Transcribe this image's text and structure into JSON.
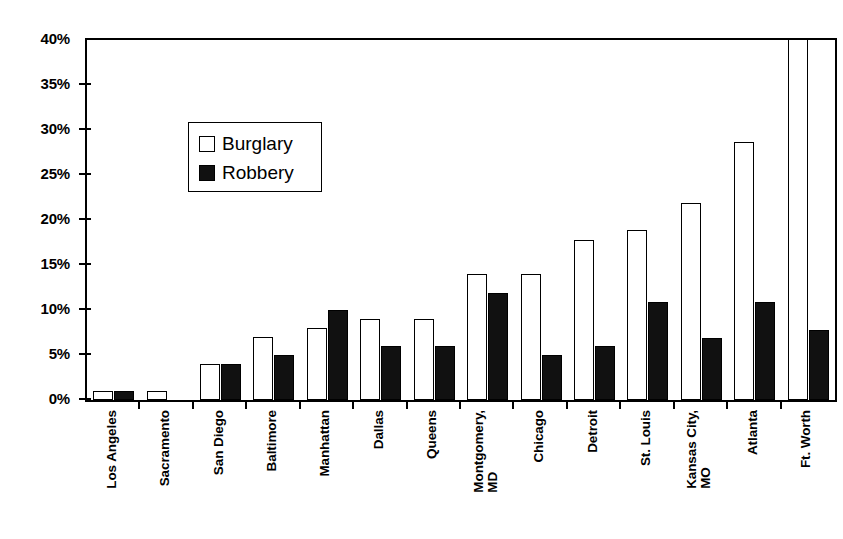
{
  "chart_data": {
    "type": "bar",
    "title": "",
    "subtitle": "",
    "xlabel": "",
    "ylabel": "",
    "ylim": [
      0,
      40
    ],
    "ytick_step": 5,
    "ytick_labels": [
      "40%",
      "35%",
      "30%",
      "25%",
      "20%",
      "15%",
      "10%",
      "5%",
      "0%"
    ],
    "ytick_values": [
      40,
      35,
      30,
      25,
      20,
      15,
      10,
      5,
      0
    ],
    "grid": false,
    "legend_position": "inside-upper-left",
    "value_suffix": "%",
    "categories": [
      "Los Angeles",
      "Sacramento",
      "San Diego",
      "Baltimore",
      "Manhattan",
      "Dallas",
      "Queens",
      "Montgomery, MD",
      "Chicago",
      "Detroit",
      "St. Louis",
      "Kansas City, MO",
      "Atlanta",
      "Ft. Worth"
    ],
    "category_label_lines": [
      [
        "Los Angeles"
      ],
      [
        "Sacramento"
      ],
      [
        "San Diego"
      ],
      [
        "Baltimore"
      ],
      [
        "Manhattan"
      ],
      [
        "Dallas"
      ],
      [
        "Queens"
      ],
      [
        "Montgomery,",
        "MD"
      ],
      [
        "Chicago"
      ],
      [
        "Detroit"
      ],
      [
        "St. Louis"
      ],
      [
        "Kansas City,",
        "MO"
      ],
      [
        "Atlanta"
      ],
      [
        "Ft. Worth"
      ]
    ],
    "series": [
      {
        "name": "Burglary",
        "style": "open",
        "color": "#ffffff",
        "edge_color": "#000000",
        "values": [
          1,
          1,
          4,
          7,
          8,
          9,
          9,
          14,
          14,
          17.8,
          18.9,
          21.9,
          28.7,
          40
        ],
        "clipped_indices": [
          13
        ]
      },
      {
        "name": "Robbery",
        "style": "filled",
        "color": "#111111",
        "edge_color": "#000000",
        "values": [
          1,
          0,
          4,
          5,
          10,
          6,
          6,
          11.9,
          5,
          6,
          10.9,
          6.9,
          10.9,
          7.8
        ],
        "clipped_indices": []
      }
    ]
  },
  "legend": {
    "items": [
      {
        "label": "Burglary",
        "swatch": "open-square"
      },
      {
        "label": "Robbery",
        "swatch": "filled-square"
      }
    ]
  },
  "colors": {
    "background": "#ffffff",
    "axis": "#000000",
    "burglary": "#ffffff",
    "robbery": "#111111"
  }
}
